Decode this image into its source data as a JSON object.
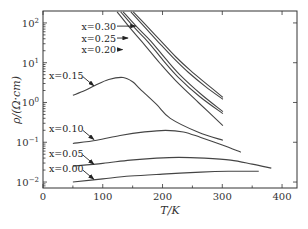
{
  "chart_data": {
    "type": "line",
    "title": "",
    "xlabel": "T/K",
    "ylabel": "ρ/(Ω·cm)",
    "xlim": [
      0,
      425
    ],
    "ylim_log10": [
      -2.15,
      2.3
    ],
    "yscale": "log",
    "xticks": [
      0,
      100,
      200,
      300,
      400
    ],
    "xtick_labels": [
      "0",
      "100",
      "200",
      "300",
      "400"
    ],
    "yticks_log10": [
      2,
      1,
      0,
      -1,
      -2
    ],
    "ytick_labels": [
      {
        "base": "10",
        "exp": "2"
      },
      {
        "base": "10",
        "exp": "1"
      },
      {
        "base": "10",
        "exp": "0"
      },
      {
        "base": "10",
        "exp": "−1"
      },
      {
        "base": "10",
        "exp": "−2"
      }
    ],
    "grid": false,
    "series": [
      {
        "name": "x=0.30",
        "label": "x=0.30",
        "T": [
          151,
          175,
          197,
          222,
          247,
          275,
          301
        ],
        "log10_rho": [
          2.28,
          1.9,
          1.55,
          1.15,
          0.8,
          0.45,
          0.13
        ],
        "label_pos_T": 150,
        "label_pos_log10": 1.95
      },
      {
        "name": "x=0.30b",
        "label": "",
        "T": [
          147,
          171,
          193,
          218,
          243,
          272,
          301
        ],
        "log10_rho": [
          2.28,
          1.88,
          1.52,
          1.12,
          0.76,
          0.4,
          0.08
        ]
      },
      {
        "name": "x=0.25",
        "label": "x=0.25",
        "T": [
          134,
          157,
          180,
          205,
          230,
          265,
          301
        ],
        "log10_rho": [
          2.28,
          1.9,
          1.55,
          1.1,
          0.68,
          0.2,
          -0.23
        ],
        "label_pos_T": 139,
        "label_pos_log10": 1.62
      },
      {
        "name": "x=0.25b",
        "label": "",
        "T": [
          130,
          153,
          176,
          201,
          226,
          262,
          301
        ],
        "log10_rho": [
          2.28,
          1.88,
          1.52,
          1.06,
          0.64,
          0.15,
          -0.28
        ]
      },
      {
        "name": "x=0.20",
        "label": "x=0.20",
        "T": [
          124,
          147,
          171,
          196,
          222,
          260,
          301
        ],
        "log10_rho": [
          2.28,
          1.85,
          1.43,
          0.98,
          0.55,
          0.0,
          -0.58
        ],
        "label_pos_T": 130,
        "label_pos_log10": 1.3
      },
      {
        "name": "x=0.15",
        "label": "x=0.15",
        "T": [
          50,
          70,
          87,
          110,
          134,
          150,
          163,
          190,
          213,
          260,
          301
        ],
        "log10_rho": [
          0.18,
          0.3,
          0.43,
          0.58,
          0.63,
          0.52,
          0.33,
          -0.05,
          -0.4,
          -0.75,
          -0.95
        ],
        "label_pos_T": 83,
        "label_pos_log10": 0.47
      },
      {
        "name": "x=0.10",
        "label": "x=0.10",
        "T": [
          50,
          90,
          129,
          170,
          205,
          235,
          264,
          300,
          331
        ],
        "log10_rho": [
          -1.03,
          -0.95,
          -0.83,
          -0.74,
          -0.7,
          -0.74,
          -0.88,
          -1.07,
          -1.25
        ],
        "label_pos_T": 83,
        "label_pos_log10": -0.88
      },
      {
        "name": "x=0.05",
        "label": "x=0.05",
        "T": [
          50,
          100,
          146,
          190,
          227,
          270,
          314,
          350,
          382
        ],
        "log10_rho": [
          -1.6,
          -1.53,
          -1.45,
          -1.4,
          -1.38,
          -1.4,
          -1.45,
          -1.55,
          -1.65
        ],
        "label_pos_T": 83,
        "label_pos_log10": -1.5
      },
      {
        "name": "x=0.00",
        "label": "x=0.00",
        "T": [
          50,
          100,
          146,
          200,
          264,
          310,
          361
        ],
        "log10_rho": [
          -2.0,
          -1.92,
          -1.85,
          -1.8,
          -1.75,
          -1.73,
          -1.73
        ],
        "label_pos_T": 83,
        "label_pos_log10": -1.9
      }
    ],
    "annotations": [
      {
        "text": "x=0.30",
        "target_T": 155,
        "target_log10": 1.92,
        "side": "left-inline"
      },
      {
        "text": "x=0.25",
        "target_T": 142,
        "target_log10": 1.62,
        "side": "left-inline"
      },
      {
        "text": "x=0.20",
        "target_T": 133,
        "target_log10": 1.33,
        "side": "left-inline"
      },
      {
        "text": "x=0.15",
        "target_T": 85,
        "target_log10": 0.42,
        "side": "upper-left"
      },
      {
        "text": "x=0.10",
        "target_T": 85,
        "target_log10": -0.93,
        "side": "upper-left"
      },
      {
        "text": "x=0.05",
        "target_T": 85,
        "target_log10": -1.55,
        "side": "upper-left"
      },
      {
        "text": "x=0.00",
        "target_T": 85,
        "target_log10": -1.93,
        "side": "upper-left"
      }
    ]
  }
}
